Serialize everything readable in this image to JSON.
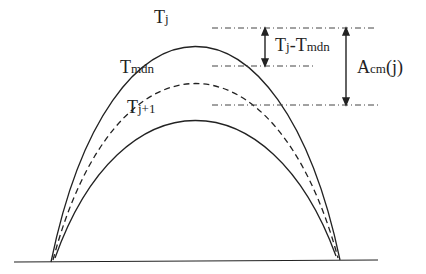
{
  "labels": {
    "tj": {
      "main": "T",
      "sub": "j"
    },
    "tmdn": {
      "main": "T",
      "sub": "mdn"
    },
    "tj1": {
      "main": "T",
      "sub": "j+1"
    },
    "diff": {
      "m1": "T",
      "s1": "j",
      "dash": "-",
      "m2": "T",
      "s2": "mdn"
    },
    "acm": {
      "main": "A",
      "sub": "cm",
      "arg": "(j)"
    }
  },
  "colors": {
    "line": "#222222"
  }
}
